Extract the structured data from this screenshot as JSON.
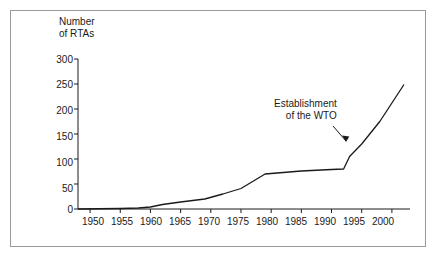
{
  "figure": {
    "border_color": "#9a9a9a",
    "line_color": "#1a1a1a",
    "background": "#ffffff"
  },
  "chart_data": {
    "type": "line",
    "title": "",
    "xlabel": "",
    "ylabel": "Number\nof RTAs",
    "ylabel_line1": "Number",
    "ylabel_line2": "of RTAs",
    "xlim": [
      1948,
      2003
    ],
    "ylim": [
      0,
      300
    ],
    "yticks": [
      0,
      50,
      100,
      150,
      200,
      250,
      300
    ],
    "ytick_labels": [
      "0",
      "50",
      "100",
      "150",
      "200",
      "250",
      "300"
    ],
    "xticks": [
      1950,
      1955,
      1960,
      1965,
      1970,
      1975,
      1980,
      1985,
      1990,
      1995,
      2000
    ],
    "xtick_labels": [
      "1950",
      "1955",
      "1960",
      "1965",
      "1970",
      "1975",
      "1980",
      "1985",
      "1990",
      "1995",
      "2000"
    ],
    "grid": false,
    "legend": null,
    "series": [
      {
        "name": "Number of RTAs",
        "x": [
          1948,
          1955,
          1958,
          1960,
          1962,
          1965,
          1969,
          1972,
          1975,
          1979,
          1985,
          1990,
          1992,
          1993,
          1995,
          1998,
          2002
        ],
        "values": [
          0,
          1,
          2,
          4,
          9,
          14,
          20,
          30,
          41,
          70,
          76,
          79,
          80,
          105,
          130,
          175,
          249
        ]
      }
    ],
    "annotations": [
      {
        "text_line1": "Establishment",
        "text_line2": "of the WTO",
        "text": "Establishment of the WTO",
        "points_to_x": 1995,
        "points_to_y": 130
      }
    ]
  }
}
